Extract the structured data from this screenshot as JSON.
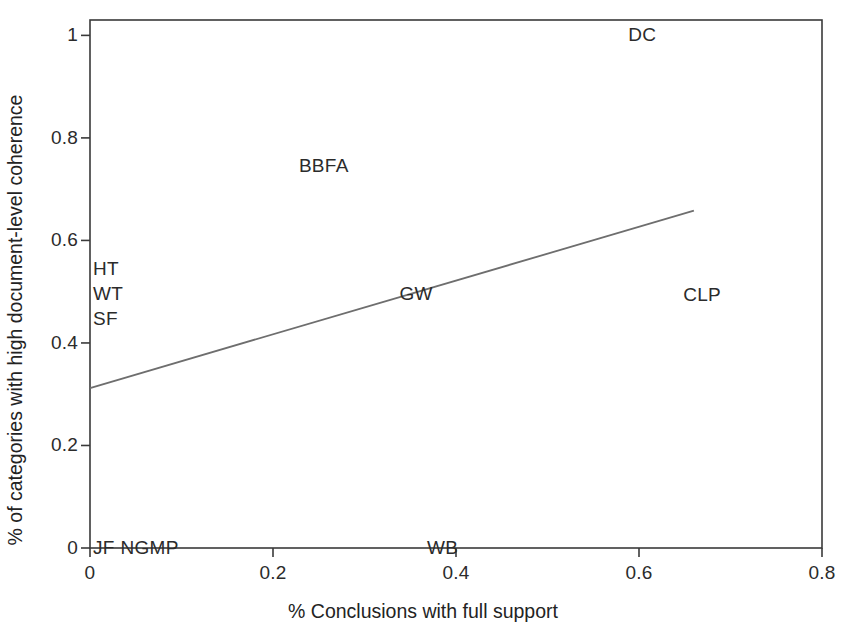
{
  "chart_data": {
    "type": "scatter",
    "title": "",
    "xlabel": "% Conclusions with full support",
    "ylabel": "% of categories with high document-level coherence",
    "xlim": [
      0,
      0.8
    ],
    "ylim": [
      0,
      1.03
    ],
    "grid": false,
    "legend": "none",
    "xticks": [
      "0",
      "0.2",
      "0.4",
      "0.6",
      "0.8"
    ],
    "xtick_values": [
      0,
      0.2,
      0.4,
      0.6,
      0.8
    ],
    "yticks": [
      "0",
      "0.2",
      "0.4",
      "0.6",
      "0.8",
      "1"
    ],
    "ytick_values": [
      0,
      0.2,
      0.4,
      0.6,
      0.8,
      1
    ],
    "points": [
      {
        "label": "DC",
        "x": 0.585,
        "y": 1.0
      },
      {
        "label": "BBFA",
        "x": 0.225,
        "y": 0.745
      },
      {
        "label": "HT",
        "x": 0.0,
        "y": 0.545
      },
      {
        "label": "WT",
        "x": 0.0,
        "y": 0.495
      },
      {
        "label": "SF",
        "x": 0.0,
        "y": 0.447
      },
      {
        "label": "GW",
        "x": 0.335,
        "y": 0.495
      },
      {
        "label": "CLP",
        "x": 0.645,
        "y": 0.493
      },
      {
        "label": "JF",
        "x": 0.0,
        "y": 0.0
      },
      {
        "label": "NGMP",
        "x": 0.03,
        "y": 0.0
      },
      {
        "label": "WB",
        "x": 0.365,
        "y": 0.0
      }
    ],
    "trendline": {
      "x_start": 0.0,
      "y_start": 0.312,
      "x_end": 0.66,
      "y_end": 0.658,
      "color": "#6e6e6e"
    },
    "axis_color": "#3a3a3a",
    "background": "#ffffff"
  }
}
